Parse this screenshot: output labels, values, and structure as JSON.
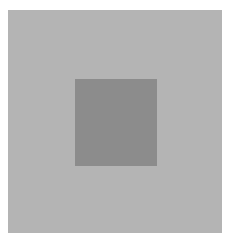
{
  "image": {
    "description": "Darker gray square centered within a larger light gray square on white background",
    "background_color": "#ffffff",
    "outer_square": {
      "color": "#b4b4b4",
      "x": 8,
      "y": 10,
      "width": 214,
      "height": 223
    },
    "inner_square": {
      "color": "#8c8c8c",
      "x": 75,
      "y": 79,
      "width": 82,
      "height": 87
    }
  }
}
